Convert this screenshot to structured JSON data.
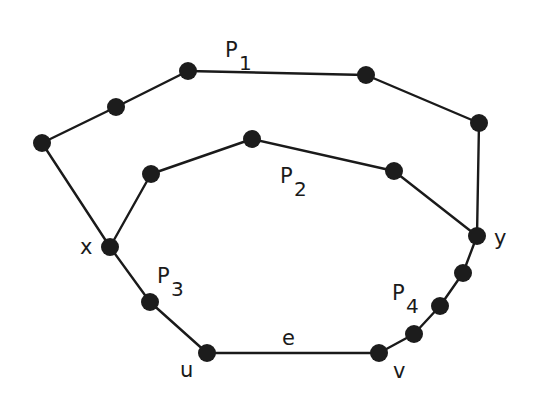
{
  "diagram": {
    "type": "graph",
    "colors": {
      "background": "#ffffff",
      "ink": "#1a1a1a"
    },
    "node_radius": 9,
    "nodes": [
      {
        "id": "a",
        "x": 42,
        "y": 143,
        "label": ""
      },
      {
        "id": "p1a",
        "x": 116,
        "y": 107,
        "label": ""
      },
      {
        "id": "p1b",
        "x": 188,
        "y": 71,
        "label": ""
      },
      {
        "id": "p1c",
        "x": 366,
        "y": 75,
        "label": ""
      },
      {
        "id": "b",
        "x": 479,
        "y": 123,
        "label": ""
      },
      {
        "id": "x",
        "x": 110,
        "y": 247,
        "label": "x"
      },
      {
        "id": "p2a",
        "x": 151,
        "y": 174,
        "label": ""
      },
      {
        "id": "p2b",
        "x": 252,
        "y": 139,
        "label": ""
      },
      {
        "id": "p2c",
        "x": 394,
        "y": 171,
        "label": ""
      },
      {
        "id": "y",
        "x": 477,
        "y": 236,
        "label": "y"
      },
      {
        "id": "p3a",
        "x": 150,
        "y": 302,
        "label": ""
      },
      {
        "id": "u",
        "x": 207,
        "y": 353,
        "label": "u"
      },
      {
        "id": "v",
        "x": 379,
        "y": 353,
        "label": "v"
      },
      {
        "id": "p4a",
        "x": 463,
        "y": 273,
        "label": ""
      },
      {
        "id": "p4b",
        "x": 440,
        "y": 306,
        "label": ""
      },
      {
        "id": "p4c",
        "x": 414,
        "y": 334,
        "label": ""
      }
    ],
    "edges": [
      {
        "from": "x",
        "to": "a",
        "path": "P1"
      },
      {
        "from": "a",
        "to": "p1a",
        "path": "P1"
      },
      {
        "from": "p1a",
        "to": "p1b",
        "path": "P1"
      },
      {
        "from": "p1b",
        "to": "p1c",
        "path": "P1"
      },
      {
        "from": "p1c",
        "to": "b",
        "path": "P1"
      },
      {
        "from": "b",
        "to": "y",
        "path": "P1"
      },
      {
        "from": "x",
        "to": "p2a",
        "path": "P2"
      },
      {
        "from": "p2a",
        "to": "p2b",
        "path": "P2"
      },
      {
        "from": "p2b",
        "to": "p2c",
        "path": "P2"
      },
      {
        "from": "p2c",
        "to": "y",
        "path": "P2"
      },
      {
        "from": "x",
        "to": "p3a",
        "path": "P3"
      },
      {
        "from": "p3a",
        "to": "u",
        "path": "P3"
      },
      {
        "from": "u",
        "to": "v",
        "path": "e"
      },
      {
        "from": "v",
        "to": "p4c",
        "path": "P4"
      },
      {
        "from": "p4c",
        "to": "p4b",
        "path": "P4"
      },
      {
        "from": "p4b",
        "to": "p4a",
        "path": "P4"
      },
      {
        "from": "p4a",
        "to": "y",
        "path": "P4"
      }
    ],
    "labels": {
      "vertex_x": {
        "text": "x",
        "x": 80,
        "y": 254
      },
      "vertex_y": {
        "text": "y",
        "x": 494,
        "y": 245
      },
      "vertex_u": {
        "text": "u",
        "x": 180,
        "y": 377
      },
      "vertex_v": {
        "text": "v",
        "x": 393,
        "y": 378
      },
      "edge_e": {
        "text": "e",
        "x": 282,
        "y": 345
      },
      "path_P1": {
        "text": "P",
        "sub": "1",
        "x": 225,
        "y": 57
      },
      "path_P2": {
        "text": "P",
        "sub": "2",
        "x": 280,
        "y": 183
      },
      "path_P3": {
        "text": "P",
        "sub": "3",
        "x": 157,
        "y": 283
      },
      "path_P4": {
        "text": "P",
        "sub": "4",
        "x": 392,
        "y": 300
      }
    }
  }
}
